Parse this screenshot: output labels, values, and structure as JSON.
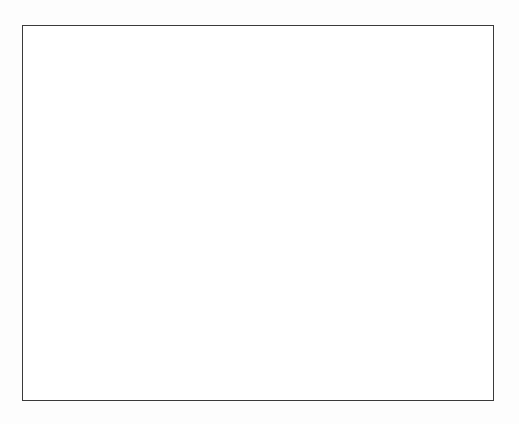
{
  "figure": {
    "title": "",
    "caption": "",
    "background_color": "#ffffff",
    "page_background_color": "#fdfdfd"
  },
  "frame": {
    "name": "plot-border",
    "x": 22,
    "y": 25,
    "width": 472,
    "height": 376,
    "stroke_color": "#3a3a3a",
    "stroke_width": 1.4
  },
  "chart_data": {
    "type": "scatter",
    "title": "",
    "subtitle": "",
    "xlabel": "",
    "ylabel": "",
    "grid": false,
    "legend": null,
    "layout": "circular",
    "ellipse": {
      "center_x": 258,
      "center_y": 212,
      "radius_x": 211,
      "radius_y": 159
    },
    "node_count": 96,
    "edge_count": 560,
    "edge_color": "#000000",
    "edge_width": 2.1,
    "node_color": "#000000",
    "node_radius": 1.6,
    "random_seed": 20240517,
    "dense_bands": [
      {
        "angle_deg": 180,
        "weight": 2.4
      },
      {
        "angle_deg": 168,
        "weight": 2.0
      },
      {
        "angle_deg": 192,
        "weight": 1.8
      },
      {
        "angle_deg": 0,
        "weight": 1.5
      },
      {
        "angle_deg": 270,
        "weight": 1.4
      }
    ],
    "x": [],
    "values": []
  }
}
